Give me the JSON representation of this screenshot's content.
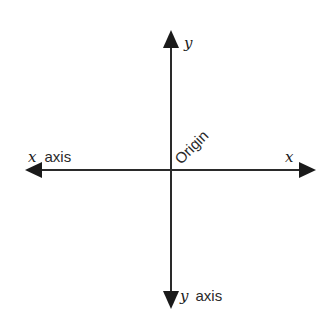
{
  "diagram": {
    "type": "coordinate-axes",
    "labels": {
      "y_top": "y",
      "x_right": "x",
      "x_left_var": "x",
      "x_left_text": "axis",
      "y_bottom_var": "y",
      "y_bottom_text": "axis",
      "origin": "Origin"
    },
    "colors": {
      "axis": "#2a2a2a",
      "background": "#ffffff"
    }
  }
}
